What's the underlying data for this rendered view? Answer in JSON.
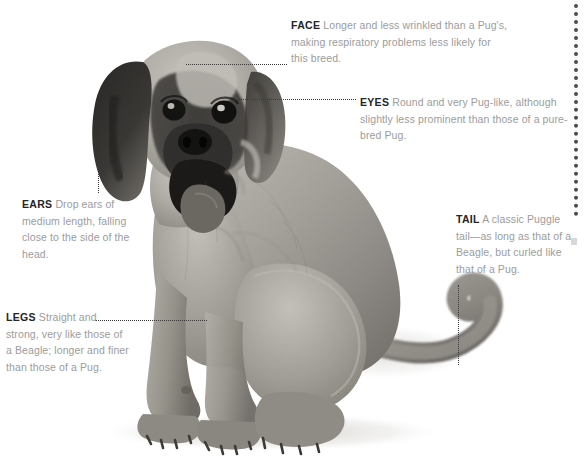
{
  "page": {
    "background_color": "#ffffff",
    "term_color": "#252525",
    "body_color": "#9c9c9c",
    "leader_color": "#3a3a3a"
  },
  "photo": {
    "alt_name": "puggle-dog-photo",
    "description": "Black and white photograph of a seated Puggle dog facing the viewer",
    "coat_light": "#b7b4ae",
    "coat_mid": "#8f8c87",
    "coat_dark": "#3a3936",
    "mask_color": "#2b2a28"
  },
  "callouts": [
    {
      "id": "face",
      "term": "FACE",
      "body": "Longer and less wrinkled than a Pug's, making respiratory problems less likely for this breed."
    },
    {
      "id": "eyes",
      "term": "EYES",
      "body": "Round and very Pug-like, although slightly less prominent than those of a pure-bred Pug."
    },
    {
      "id": "ears",
      "term": "EARS",
      "body": "Drop ears of medium length, falling close to the side of the head."
    },
    {
      "id": "tail",
      "term": "TAIL",
      "body": "A classic Puggle tail—as long as that of a Beagle, but curled like that of a Pug."
    },
    {
      "id": "legs",
      "term": "LEGS",
      "body": "Straight and strong, very like those of a Beagle; longer and finer than those of a Pug."
    }
  ],
  "decorations": {
    "edge_rule_name": "right-edge-dotted-rule",
    "edge_mark_name": "edge-square-mark"
  }
}
